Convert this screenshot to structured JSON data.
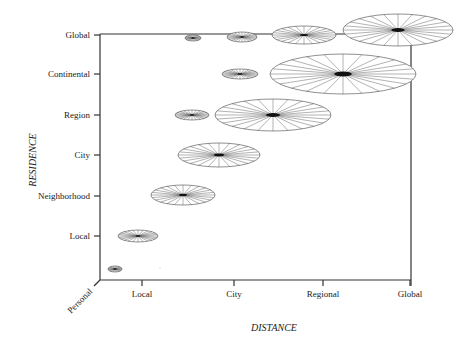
{
  "chart_data": {
    "type": "scatter",
    "title": "",
    "xlabel": "DISTANCE",
    "ylabel": "RESIDENCE",
    "origin_label": "Personal",
    "x_ticks": [
      "Local",
      "City",
      "Regional",
      "Global"
    ],
    "y_ticks": [
      "Global",
      "Continental",
      "Region",
      "City",
      "Neighborhood",
      "Local"
    ],
    "marker": "spoked ellipse (size indicates magnitude)",
    "points": [
      {
        "residence": "Personal",
        "distance": "Personal",
        "cx": 115,
        "cy": 269,
        "rx": 7,
        "ry": 3
      },
      {
        "residence": "Local",
        "distance": "Local",
        "cx": 138,
        "cy": 236,
        "rx": 20,
        "ry": 6
      },
      {
        "residence": "Neighborhood",
        "distance": "Local-City",
        "cx": 183,
        "cy": 195,
        "rx": 32,
        "ry": 10
      },
      {
        "residence": "City",
        "distance": "City",
        "cx": 219,
        "cy": 155,
        "rx": 41,
        "ry": 12
      },
      {
        "residence": "Region",
        "distance": "Local-City",
        "cx": 192,
        "cy": 115,
        "rx": 17,
        "ry": 5
      },
      {
        "residence": "Region",
        "distance": "City-Regional",
        "cx": 273,
        "cy": 115,
        "rx": 58,
        "ry": 16
      },
      {
        "residence": "Continental",
        "distance": "City",
        "cx": 240,
        "cy": 74,
        "rx": 18,
        "ry": 5
      },
      {
        "residence": "Continental",
        "distance": "Regional-Global",
        "cx": 343,
        "cy": 74,
        "rx": 73,
        "ry": 20
      },
      {
        "residence": "Global",
        "distance": "Local-City",
        "cx": 193,
        "cy": 38,
        "rx": 8,
        "ry": 3
      },
      {
        "residence": "Global",
        "distance": "City",
        "cx": 242,
        "cy": 37,
        "rx": 15,
        "ry": 5
      },
      {
        "residence": "Global",
        "distance": "City-Regional",
        "cx": 304,
        "cy": 35,
        "rx": 32,
        "ry": 9
      },
      {
        "residence": "Global",
        "distance": "Global",
        "cx": 398,
        "cy": 30,
        "rx": 55,
        "ry": 16
      }
    ],
    "grid": false,
    "legend": null
  },
  "axes": {
    "x_title": "DISTANCE",
    "y_title": "RESIDENCE",
    "origin": "Personal",
    "x_ticks": [
      {
        "label": "Local",
        "x": 142
      },
      {
        "label": "City",
        "x": 234
      },
      {
        "label": "Regional",
        "x": 323
      },
      {
        "label": "Global",
        "x": 410
      }
    ],
    "y_ticks": [
      {
        "label": "Global",
        "y": 35
      },
      {
        "label": "Continental",
        "y": 74
      },
      {
        "label": "Region",
        "y": 115
      },
      {
        "label": "City",
        "y": 155
      },
      {
        "label": "Neighborhood",
        "y": 196
      },
      {
        "label": "Local",
        "y": 236
      }
    ]
  }
}
